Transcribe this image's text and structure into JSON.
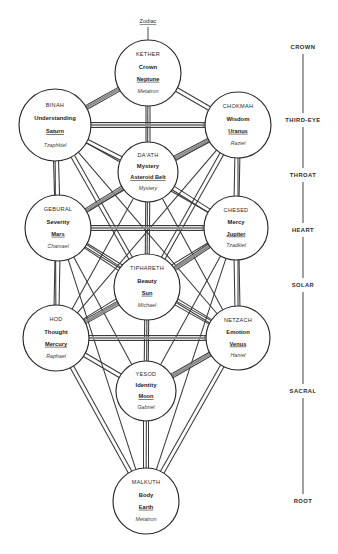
{
  "diagram": {
    "zodiac_label": "Zodiac",
    "spheres": [
      {
        "id": "kether",
        "name": "KETHER",
        "concept": "Crown",
        "planet": "Neptune",
        "angel": "Metatron",
        "cx": 148,
        "cy": 73,
        "r": 33
      },
      {
        "id": "binah",
        "name": "BINAH",
        "concept": "Understanding",
        "planet": "Saturn",
        "angel": "Tzaphkiel",
        "cx": 55,
        "cy": 125,
        "r": 36
      },
      {
        "id": "chokmah",
        "name": "CHOKMAH",
        "concept": "Wisdom",
        "planet": "Uranus",
        "angel": "Raziel",
        "cx": 238,
        "cy": 125,
        "r": 33
      },
      {
        "id": "daath",
        "name": "DA'ATH",
        "concept": "Mystery",
        "planet": "Asteroid Belt",
        "angel": "Mystery",
        "cx": 148,
        "cy": 172,
        "r": 30
      },
      {
        "id": "geburah",
        "name": "GEBURAL",
        "concept": "Severity",
        "planet": "Mars",
        "angel": "Chamael",
        "cx": 58,
        "cy": 228,
        "r": 33
      },
      {
        "id": "chesed",
        "name": "CHESED",
        "concept": "Mercy",
        "planet": "Jupiter",
        "angel": "Tzadkiel",
        "cx": 236,
        "cy": 228,
        "r": 32
      },
      {
        "id": "tiphareth",
        "name": "TIPHARETH",
        "concept": "Beauty",
        "planet": "Sun",
        "angel": "Michael",
        "cx": 147,
        "cy": 287,
        "r": 33
      },
      {
        "id": "hod",
        "name": "HOD",
        "concept": "Thought",
        "planet": "Mercury",
        "angel": "Raphael",
        "cx": 56,
        "cy": 338,
        "r": 33
      },
      {
        "id": "netzach",
        "name": "NETZACH",
        "concept": "Emotion",
        "planet": "Venus",
        "angel": "Haniel",
        "cx": 238,
        "cy": 338,
        "r": 32
      },
      {
        "id": "yesod",
        "name": "YESOD",
        "concept": "Identity",
        "planet": "Moon",
        "angel": "Gabriel",
        "cx": 146,
        "cy": 391,
        "r": 30
      },
      {
        "id": "malkuth",
        "name": "MALKUTH",
        "concept": "Body",
        "planet": "Earth",
        "angel": "Metatron",
        "cx": 146,
        "cy": 501,
        "r": 33
      }
    ],
    "chakras": [
      {
        "label": "CROWN",
        "y": 47
      },
      {
        "label": "THIRD-EYE",
        "y": 120
      },
      {
        "label": "THIRD-EYE-spacer",
        "y": -1
      },
      {
        "label": "THROAT",
        "y": 175
      },
      {
        "label": "HEART",
        "y": 230
      },
      {
        "label": "SOLAR",
        "y": 285
      },
      {
        "label": "SACRAL",
        "y": 391
      },
      {
        "label": "ROOT",
        "y": 501
      }
    ],
    "chakra_column_x": 303,
    "colors": {
      "background": "#ffffff",
      "sphere_stroke": "#2a2a2a",
      "path_line": "#3a3a3a",
      "flash_line": "#8d8d8d",
      "chakra_line": "#8a8a8a",
      "text": "#2b2b2b"
    }
  }
}
